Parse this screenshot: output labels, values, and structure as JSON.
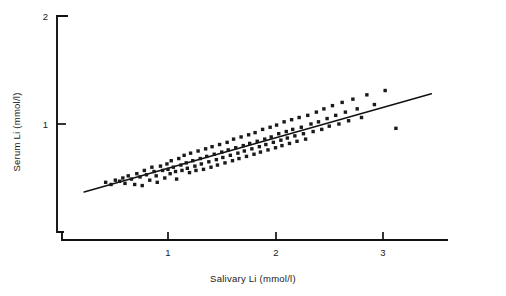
{
  "chart_data": {
    "type": "scatter",
    "title": "",
    "subtitle": "",
    "xlabel": "Salivary Li (mmol/l)",
    "ylabel": "Serum Li (mmol/l)",
    "xlim": [
      0.0,
      3.6
    ],
    "ylim": [
      0.25,
      2.0
    ],
    "xticks": [
      1,
      2,
      3
    ],
    "xtick_labels": [
      "1",
      "2",
      "3"
    ],
    "yticks": [
      1,
      2
    ],
    "ytick_labels": [
      "1",
      "2"
    ],
    "grid": false,
    "legend": null,
    "legend_position": "none",
    "annotations": [],
    "marker": "filled-square",
    "marker_size_px": 2.2,
    "point_color": "#1a1a1a",
    "line_color": "#111111",
    "axis_color": "#111111",
    "background_color": "#ffffff",
    "series": [
      {
        "name": "Patients",
        "type": "scatter",
        "n": 122,
        "x": [
          0.42,
          0.47,
          0.51,
          0.55,
          0.58,
          0.6,
          0.63,
          0.66,
          0.69,
          0.71,
          0.74,
          0.76,
          0.78,
          0.8,
          0.83,
          0.85,
          0.87,
          0.89,
          0.9,
          0.93,
          0.95,
          0.97,
          0.99,
          1.0,
          1.02,
          1.03,
          1.05,
          1.07,
          1.08,
          1.1,
          1.12,
          1.13,
          1.15,
          1.17,
          1.18,
          1.2,
          1.21,
          1.23,
          1.25,
          1.26,
          1.28,
          1.3,
          1.31,
          1.33,
          1.35,
          1.36,
          1.38,
          1.4,
          1.41,
          1.43,
          1.45,
          1.46,
          1.48,
          1.5,
          1.51,
          1.53,
          1.55,
          1.56,
          1.58,
          1.6,
          1.61,
          1.63,
          1.65,
          1.66,
          1.68,
          1.7,
          1.71,
          1.73,
          1.75,
          1.76,
          1.78,
          1.8,
          1.81,
          1.83,
          1.85,
          1.86,
          1.88,
          1.9,
          1.91,
          1.93,
          1.95,
          1.96,
          1.98,
          2.0,
          2.01,
          2.03,
          2.05,
          2.06,
          2.08,
          2.1,
          2.11,
          2.13,
          2.15,
          2.16,
          2.18,
          2.2,
          2.22,
          2.24,
          2.26,
          2.28,
          2.3,
          2.33,
          2.35,
          2.38,
          2.4,
          2.43,
          2.45,
          2.48,
          2.5,
          2.53,
          2.56,
          2.59,
          2.62,
          2.65,
          2.68,
          2.72,
          2.76,
          2.8,
          2.85,
          2.92,
          3.02,
          3.12
        ],
        "y": [
          0.46,
          0.44,
          0.48,
          0.47,
          0.5,
          0.45,
          0.52,
          0.49,
          0.44,
          0.54,
          0.51,
          0.43,
          0.57,
          0.53,
          0.48,
          0.6,
          0.56,
          0.52,
          0.46,
          0.61,
          0.57,
          0.5,
          0.63,
          0.58,
          0.54,
          0.66,
          0.6,
          0.56,
          0.49,
          0.68,
          0.62,
          0.57,
          0.71,
          0.64,
          0.59,
          0.55,
          0.73,
          0.66,
          0.61,
          0.57,
          0.75,
          0.68,
          0.63,
          0.58,
          0.77,
          0.7,
          0.65,
          0.6,
          0.79,
          0.72,
          0.67,
          0.62,
          0.81,
          0.74,
          0.69,
          0.64,
          0.83,
          0.76,
          0.71,
          0.66,
          0.86,
          0.78,
          0.73,
          0.68,
          0.88,
          0.8,
          0.75,
          0.7,
          0.9,
          0.82,
          0.77,
          0.72,
          0.92,
          0.84,
          0.79,
          0.74,
          0.95,
          0.86,
          0.81,
          0.76,
          0.97,
          0.88,
          0.83,
          0.78,
          0.99,
          0.91,
          0.85,
          0.8,
          1.02,
          0.93,
          0.87,
          0.82,
          1.04,
          0.95,
          0.89,
          0.84,
          1.06,
          0.97,
          0.91,
          0.86,
          1.08,
          1.0,
          0.93,
          1.11,
          1.02,
          0.95,
          1.14,
          1.05,
          0.98,
          1.17,
          1.08,
          1.0,
          1.2,
          1.11,
          1.03,
          1.23,
          1.14,
          1.06,
          1.27,
          1.18,
          1.31,
          0.96
        ]
      },
      {
        "name": "Regression line",
        "type": "line",
        "x": [
          0.22,
          3.45
        ],
        "y": [
          0.37,
          1.28
        ]
      }
    ]
  },
  "axes": {
    "y_label": "Serum Li (mmol/l)",
    "x_label": "Salivary Li (mmol/l)",
    "y_tick_top": "2",
    "y_tick_mid": "1",
    "x_tick_1": "1",
    "x_tick_2": "2",
    "x_tick_3": "3"
  }
}
